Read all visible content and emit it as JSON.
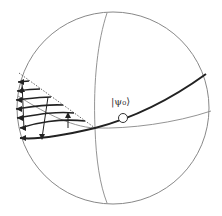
{
  "diagram": {
    "type": "bloch-sphere",
    "state_label": "|ψ₀⟩",
    "colors": {
      "background": "#ffffff",
      "thin_line": "#777777",
      "thick_line": "#222222",
      "dotted_line": "#555555"
    },
    "elements": [
      "sphere-outline",
      "equator",
      "meridian",
      "trajectory-curve",
      "state-point",
      "shaded-region-flow-arrows",
      "dotted-boundary"
    ]
  }
}
